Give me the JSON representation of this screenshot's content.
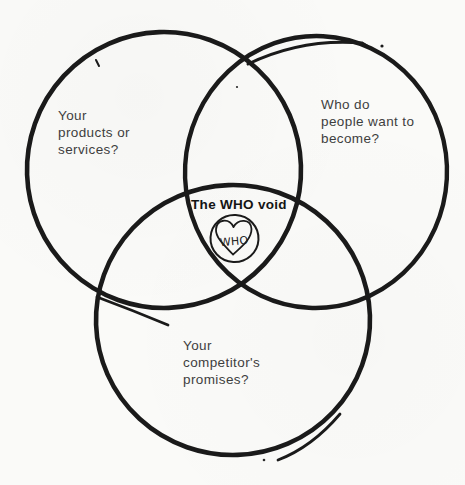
{
  "diagram": {
    "type": "venn-3-circle",
    "title": "The WHO void",
    "circles": [
      {
        "id": "products",
        "label": "Your\nproducts or\nservices?"
      },
      {
        "id": "become",
        "label": "Who do\npeople want to\nbecome?"
      },
      {
        "id": "competitor",
        "label": "Your\ncompetitor's\npromises?"
      }
    ],
    "center": {
      "label": "The WHO void",
      "icon": "heart-in-circle-icon",
      "icon_text": "WHO"
    },
    "colors": {
      "ink_stroke": "#1a1a1a",
      "label_text": "#3e3e3e",
      "title_text": "#141414",
      "background": "#fafaf8"
    }
  }
}
